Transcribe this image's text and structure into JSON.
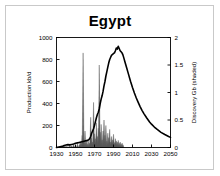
{
  "chart_data": {
    "type": "area",
    "title": "Egypt",
    "xlabel": "",
    "ylabel": "Production kb/d",
    "y2label": "Discovery Gb (shaded)",
    "xlim": [
      1930,
      2050
    ],
    "ylim": [
      0,
      1000
    ],
    "y2lim": [
      0,
      2
    ],
    "xticks": [
      1930,
      1950,
      1970,
      1990,
      2010,
      2030,
      2050
    ],
    "yticks": [
      0,
      200,
      400,
      600,
      800,
      1000
    ],
    "y2ticks": [
      0,
      0.5,
      1,
      1.5,
      2
    ],
    "grid": false,
    "legend": false,
    "colors": {
      "production_line": "#000000",
      "discovery_fill": "#555555",
      "axis": "#000000",
      "frame": "#c9c9c9",
      "background": "#ffffff"
    },
    "series": [
      {
        "name": "Production kb/d",
        "type": "line",
        "axis": "left",
        "units": "kb/d",
        "x": [
          1930,
          1936,
          1938,
          1940,
          1942,
          1944,
          1946,
          1948,
          1950,
          1952,
          1954,
          1956,
          1958,
          1960,
          1962,
          1964,
          1965,
          1966,
          1967,
          1968,
          1969,
          1970,
          1971,
          1972,
          1973,
          1974,
          1975,
          1976,
          1977,
          1978,
          1979,
          1980,
          1981,
          1982,
          1983,
          1984,
          1985,
          1986,
          1987,
          1988,
          1989,
          1990,
          1991,
          1992,
          1993,
          1994,
          1995,
          1996,
          1997,
          1998,
          1999,
          2000,
          2001,
          2002,
          2003,
          2004,
          2005,
          2006,
          2007,
          2008,
          2010,
          2012,
          2014,
          2016,
          2018,
          2020,
          2022,
          2025,
          2028,
          2030,
          2033,
          2036,
          2040,
          2044,
          2048,
          2050
        ],
        "y": [
          0,
          10,
          18,
          22,
          26,
          24,
          28,
          32,
          38,
          42,
          46,
          50,
          55,
          60,
          62,
          70,
          82,
          100,
          130,
          150,
          170,
          200,
          235,
          270,
          300,
          320,
          350,
          400,
          440,
          470,
          510,
          560,
          600,
          650,
          690,
          730,
          770,
          800,
          820,
          840,
          845,
          855,
          860,
          880,
          905,
          895,
          920,
          900,
          880,
          870,
          860,
          840,
          810,
          780,
          750,
          720,
          690,
          660,
          630,
          600,
          545,
          495,
          450,
          410,
          372,
          338,
          308,
          268,
          232,
          212,
          186,
          164,
          138,
          118,
          100,
          92
        ]
      },
      {
        "name": "Discovery Gb (shaded)",
        "type": "spikes",
        "axis": "right",
        "units": "Gb",
        "x": [
          1938,
          1940,
          1942,
          1944,
          1946,
          1948,
          1950,
          1952,
          1954,
          1955,
          1956,
          1957,
          1958,
          1959,
          1960,
          1961,
          1962,
          1963,
          1964,
          1965,
          1966,
          1967,
          1968,
          1969,
          1970,
          1971,
          1972,
          1973,
          1974,
          1975,
          1976,
          1977,
          1978,
          1979,
          1980,
          1981,
          1982,
          1983,
          1984,
          1985,
          1986,
          1987,
          1988,
          1989,
          1990,
          1991,
          1992,
          1993,
          1994,
          1995,
          1996,
          1997,
          1998,
          1999,
          2000
        ],
        "y": [
          0.04,
          0.03,
          0.02,
          0.05,
          0.03,
          0.06,
          0.04,
          0.07,
          0.05,
          0.12,
          0.08,
          0.22,
          1.72,
          0.1,
          0.3,
          0.09,
          0.15,
          0.06,
          0.12,
          0.08,
          0.55,
          0.18,
          0.1,
          0.82,
          0.25,
          0.16,
          0.45,
          0.2,
          0.35,
          1.5,
          0.28,
          0.42,
          0.14,
          0.3,
          0.5,
          0.22,
          0.4,
          0.12,
          0.26,
          0.18,
          0.33,
          0.1,
          0.2,
          0.14,
          0.24,
          0.09,
          0.16,
          0.12,
          0.1,
          0.13,
          0.08,
          0.1,
          0.06,
          0.08,
          0.05
        ]
      }
    ]
  }
}
